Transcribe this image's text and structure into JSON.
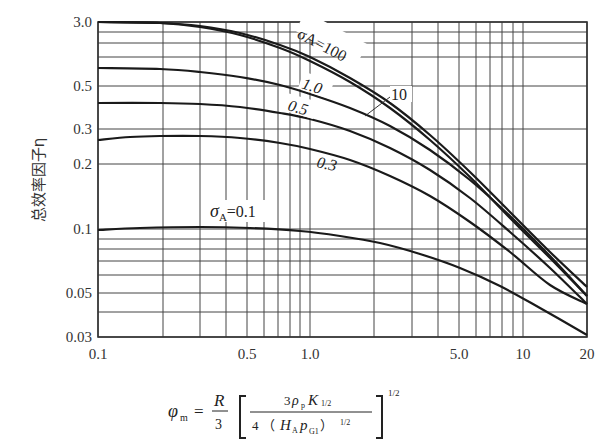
{
  "chart_data": {
    "type": "line",
    "title": "",
    "xlabel": "φm = (R/3)[3ρp K1/2 / (4 (HA pG1)^1/2)]^1/2",
    "ylabel": "总效率因子η",
    "xscale": "log",
    "yscale": "log",
    "xlim": [
      0.1,
      20
    ],
    "ylim": [
      0.03,
      3.0
    ],
    "grid": true,
    "x_tick_labels": [
      "0.1",
      "0.5",
      "1.0",
      "5.0",
      "10",
      "20"
    ],
    "y_tick_labels": [
      "3.0",
      "0.5",
      "0.3",
      "0.2",
      "0.1",
      "0.05",
      "0.03"
    ],
    "series": [
      {
        "name": "σA=100",
        "label": "σA=100",
        "points_px": [
          [
            98,
            22
          ],
          [
            160,
            23
          ],
          [
            200,
            26
          ],
          [
            240,
            33
          ],
          [
            280,
            45
          ],
          [
            310,
            57
          ],
          [
            350,
            78
          ],
          [
            390,
            103
          ],
          [
            430,
            135
          ],
          [
            470,
            172
          ],
          [
            510,
            212
          ],
          [
            550,
            252
          ],
          [
            587,
            287
          ]
        ]
      },
      {
        "name": "σA=10",
        "label": "10",
        "points_px": [
          [
            98,
            22
          ],
          [
            160,
            23
          ],
          [
            200,
            27
          ],
          [
            240,
            35
          ],
          [
            280,
            48
          ],
          [
            310,
            61
          ],
          [
            350,
            82
          ],
          [
            390,
            108
          ],
          [
            430,
            140
          ],
          [
            470,
            177
          ],
          [
            510,
            218
          ],
          [
            550,
            258
          ],
          [
            587,
            296
          ]
        ]
      },
      {
        "name": "σA=1.0",
        "label": "1.0",
        "points_px": [
          [
            98,
            68
          ],
          [
            160,
            69
          ],
          [
            200,
            72
          ],
          [
            240,
            77
          ],
          [
            280,
            85
          ],
          [
            310,
            94
          ],
          [
            350,
            108
          ],
          [
            390,
            126
          ],
          [
            430,
            150
          ],
          [
            470,
            180
          ],
          [
            510,
            216
          ],
          [
            550,
            256
          ],
          [
            587,
            296
          ]
        ]
      },
      {
        "name": "σA=0.5",
        "label": "0.5",
        "points_px": [
          [
            98,
            103
          ],
          [
            160,
            103
          ],
          [
            200,
            104
          ],
          [
            240,
            107
          ],
          [
            280,
            113
          ],
          [
            310,
            119
          ],
          [
            350,
            131
          ],
          [
            390,
            148
          ],
          [
            430,
            170
          ],
          [
            470,
            198
          ],
          [
            510,
            232
          ],
          [
            550,
            268
          ],
          [
            587,
            304
          ]
        ]
      },
      {
        "name": "σA=0.3",
        "label": "0.3",
        "points_px": [
          [
            98,
            140
          ],
          [
            130,
            137
          ],
          [
            160,
            136
          ],
          [
            200,
            136
          ],
          [
            240,
            138
          ],
          [
            280,
            143
          ],
          [
            310,
            149
          ],
          [
            350,
            160
          ],
          [
            390,
            176
          ],
          [
            430,
            196
          ],
          [
            470,
            222
          ],
          [
            510,
            252
          ],
          [
            550,
            285
          ],
          [
            587,
            304
          ]
        ]
      },
      {
        "name": "σA=0.1",
        "label": "σA=0.1",
        "points_px": [
          [
            98,
            230
          ],
          [
            140,
            228
          ],
          [
            200,
            227
          ],
          [
            250,
            228
          ],
          [
            300,
            231
          ],
          [
            340,
            236
          ],
          [
            380,
            243
          ],
          [
            420,
            254
          ],
          [
            460,
            268
          ],
          [
            500,
            286
          ],
          [
            540,
            308
          ],
          [
            587,
            335
          ]
        ]
      }
    ]
  },
  "axes": {
    "y_label": "总效率因子η",
    "y_ticks": [
      {
        "label": "3.0",
        "y": 22
      },
      {
        "label": "0.5",
        "y": 86
      },
      {
        "label": "0.3",
        "y": 129
      },
      {
        "label": "0.2",
        "y": 164
      },
      {
        "label": "0.1",
        "y": 229
      },
      {
        "label": "0.05",
        "y": 293
      },
      {
        "label": "0.03",
        "y": 337
      }
    ],
    "x_ticks": [
      {
        "label": "0.1",
        "x": 98
      },
      {
        "label": "0.5",
        "x": 247
      },
      {
        "label": "1.0",
        "x": 310
      },
      {
        "label": "5.0",
        "x": 459
      },
      {
        "label": "10",
        "x": 523
      },
      {
        "label": "20",
        "x": 587
      }
    ],
    "h_grid": [
      22,
      32,
      43,
      57,
      86,
      129,
      164,
      229,
      239,
      249,
      261,
      275,
      293,
      312,
      337
    ],
    "v_grid": [
      98,
      163,
      200,
      226,
      247,
      264,
      278,
      290,
      300,
      310,
      374,
      412,
      438,
      459,
      476,
      490,
      502,
      513,
      523,
      587
    ]
  },
  "curve_labels": {
    "s100": "σA=100",
    "s10": "10",
    "s1": "1.0",
    "s05": "0.5",
    "s03": "0.3",
    "s01_sigma": "σ",
    "s01_sub": "A",
    "s01_val": "=0.1"
  },
  "formula": {
    "lhs": "φ",
    "lhs_sub": "m",
    "eq": "=",
    "R": "R",
    "three": "3",
    "num_3": "3",
    "num_rho": "ρ",
    "num_rho_sub": "p",
    "num_K": "K",
    "num_K_sub": "1/2",
    "den_4": "4",
    "den_open": "（",
    "den_H": "H",
    "den_H_sub": "A",
    "den_p": "p",
    "den_p_sub": "G1",
    "den_close": "）",
    "den_exp": "1/2",
    "outer_exp": "1/2"
  }
}
